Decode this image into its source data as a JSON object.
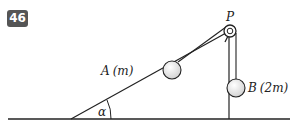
{
  "problem_number": "46",
  "labels": {
    "pulley": "P",
    "mass_a_name": "A",
    "mass_a_value": "(m)",
    "mass_b_name": "B",
    "mass_b_value": "(2m)",
    "angle": "α"
  },
  "colors": {
    "badge_bg": "#555555",
    "line": "#222222",
    "ball_fill": "#eeeeee"
  }
}
